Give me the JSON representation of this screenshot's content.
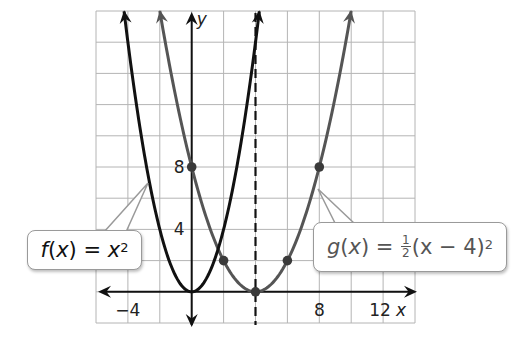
{
  "chart_data": {
    "type": "line",
    "title": "",
    "xlabel": "x",
    "ylabel": "y",
    "xlim": [
      -6,
      14
    ],
    "ylim": [
      -2,
      18
    ],
    "grid": true,
    "grid_step": 2,
    "x_tick_labels": [
      {
        "value": -4,
        "label": "−4"
      },
      {
        "value": 8,
        "label": "8"
      },
      {
        "value": 12,
        "label": "12"
      }
    ],
    "y_tick_labels": [
      {
        "value": 4,
        "label": "4"
      },
      {
        "value": 8,
        "label": "8"
      }
    ],
    "axis_of_symmetry": {
      "x": 4,
      "style": "dashed",
      "color": "#111111"
    },
    "series": [
      {
        "name": "f(x) = x^2",
        "expression": "x^2",
        "color": "#111111",
        "domain": [
          -4.24,
          4.24
        ],
        "points": []
      },
      {
        "name": "g(x) = 1/2(x - 4)^2",
        "expression": "0.5*(x-4)^2",
        "color": "#555555",
        "domain": [
          -2,
          10
        ],
        "points": [
          [
            0,
            8
          ],
          [
            2,
            2
          ],
          [
            4,
            0
          ],
          [
            6,
            2
          ],
          [
            8,
            8
          ]
        ]
      }
    ],
    "annotations": [
      {
        "target": "f",
        "text": "f(x) = x²"
      },
      {
        "target": "g",
        "text": "g(x) = ½(x − 4)²"
      }
    ]
  },
  "labels": {
    "x_axis": "x",
    "y_axis": "y",
    "f_callout": {
      "name": "f",
      "arg": "(x)",
      "eq": " = ",
      "base": "x",
      "exp": "2"
    },
    "g_callout": {
      "name": "g",
      "arg": "(x)",
      "eq": " = ",
      "num": "1",
      "den": "2",
      "open": "(x − 4)",
      "exp": "2"
    }
  },
  "colors": {
    "f": "#111111",
    "g": "#555555",
    "grid": "#b4b4b4"
  }
}
